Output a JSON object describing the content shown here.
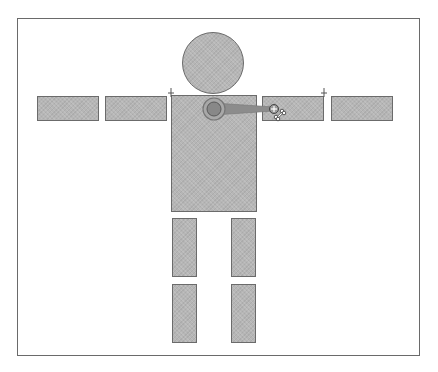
{
  "diagram": {
    "colors": {
      "frame_border": "#6a6a6a",
      "part_fill": "#b6b6b6",
      "part_border": "#6b6b6b",
      "joint_inner": "#8a8a8a",
      "bone_line": "#8c8c8c"
    },
    "parts": [
      {
        "id": "head",
        "shape": "circle",
        "cx": 213,
        "cy": 63,
        "r": 31
      },
      {
        "id": "torso",
        "shape": "rect",
        "x": 171,
        "y": 95,
        "w": 86,
        "h": 117
      },
      {
        "id": "left-forearm",
        "shape": "rect",
        "x": 37,
        "y": 96,
        "w": 62,
        "h": 25
      },
      {
        "id": "left-upper-arm",
        "shape": "rect",
        "x": 105,
        "y": 96,
        "w": 62,
        "h": 25
      },
      {
        "id": "right-upper-arm",
        "shape": "rect",
        "x": 262,
        "y": 96,
        "w": 62,
        "h": 25
      },
      {
        "id": "right-forearm",
        "shape": "rect",
        "x": 331,
        "y": 96,
        "w": 62,
        "h": 25
      },
      {
        "id": "left-thigh",
        "shape": "rect",
        "x": 172,
        "y": 218,
        "w": 25,
        "h": 59
      },
      {
        "id": "right-thigh",
        "shape": "rect",
        "x": 231,
        "y": 218,
        "w": 25,
        "h": 59
      },
      {
        "id": "left-shin",
        "shape": "rect",
        "x": 172,
        "y": 284,
        "w": 25,
        "h": 59
      },
      {
        "id": "right-shin",
        "shape": "rect",
        "x": 231,
        "y": 284,
        "w": 25,
        "h": 59
      }
    ],
    "joint": {
      "cx": 214,
      "cy": 109,
      "r_outer": 11,
      "r_inner": 7
    },
    "bone": {
      "x1": 214,
      "y1": 109,
      "x2": 274,
      "y2": 109
    },
    "pivots": [
      {
        "x": 171,
        "y": 92
      },
      {
        "x": 324,
        "y": 92
      }
    ],
    "cursor": {
      "type": "bone-tool-crosshair",
      "x": 274,
      "y": 109
    }
  }
}
